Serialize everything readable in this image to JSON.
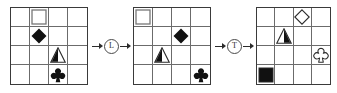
{
  "figure": {
    "type": "shape-transformation-sequence",
    "grid_rows": 4,
    "grid_cols": 4,
    "panel_count": 3
  },
  "panels": [
    {
      "name": "panel-1",
      "cells": [
        {
          "row": 1,
          "col": 2,
          "shape": "square",
          "fill": "white",
          "icon_name": "square-outline-icon"
        },
        {
          "row": 2,
          "col": 2,
          "shape": "diamond",
          "fill": "black",
          "icon_name": "diamond-filled-icon"
        },
        {
          "row": 3,
          "col": 3,
          "shape": "triangle",
          "fill": "half-left",
          "icon_name": "triangle-half-filled-icon"
        },
        {
          "row": 4,
          "col": 3,
          "shape": "club",
          "fill": "black",
          "icon_name": "club-filled-icon"
        }
      ]
    },
    {
      "name": "panel-2",
      "cells": [
        {
          "row": 1,
          "col": 1,
          "shape": "square",
          "fill": "white",
          "icon_name": "square-outline-icon"
        },
        {
          "row": 2,
          "col": 3,
          "shape": "diamond",
          "fill": "black",
          "icon_name": "diamond-filled-icon"
        },
        {
          "row": 3,
          "col": 2,
          "shape": "triangle",
          "fill": "half-left",
          "icon_name": "triangle-half-filled-icon"
        },
        {
          "row": 4,
          "col": 4,
          "shape": "club",
          "fill": "black",
          "icon_name": "club-filled-icon"
        }
      ]
    },
    {
      "name": "panel-3",
      "cells": [
        {
          "row": 1,
          "col": 3,
          "shape": "diamond",
          "fill": "white",
          "icon_name": "diamond-outline-icon"
        },
        {
          "row": 2,
          "col": 2,
          "shape": "triangle",
          "fill": "half-right",
          "icon_name": "triangle-half-filled-icon"
        },
        {
          "row": 3,
          "col": 4,
          "shape": "club",
          "fill": "white",
          "icon_name": "club-outline-icon"
        },
        {
          "row": 4,
          "col": 1,
          "shape": "square",
          "fill": "black",
          "icon_name": "square-filled-icon"
        }
      ]
    }
  ],
  "operators": [
    {
      "name": "operator-1",
      "label": "L"
    },
    {
      "name": "operator-2",
      "label": "T"
    }
  ],
  "colors": {
    "fill_black": "#111111",
    "stroke": "#2b2b2b",
    "grid_line": "#6b6b6b",
    "grid_border": "#3a3a3a",
    "background": "#ffffff"
  }
}
